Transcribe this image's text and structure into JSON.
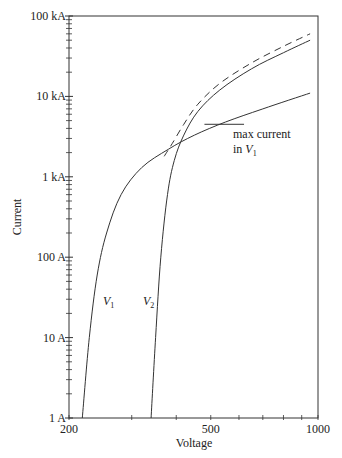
{
  "chart_data": {
    "type": "line",
    "title": "",
    "xlabel": "Voltage",
    "ylabel": "Current",
    "xscale": "log",
    "yscale": "log",
    "xlim": [
      200,
      1000
    ],
    "ylim": [
      1,
      100000
    ],
    "x_tick_labels": [
      "200",
      "500",
      "1000"
    ],
    "x_ticks": [
      200,
      300,
      400,
      500,
      600,
      700,
      800,
      900,
      1000
    ],
    "y_tick_labels": [
      "1 A",
      "10 A",
      "100 A",
      "1 kA",
      "10 kA",
      "100 kA"
    ],
    "y_ticks": [
      1,
      10,
      100,
      1000,
      10000,
      100000
    ],
    "grid": false,
    "legend": null,
    "series": [
      {
        "name": "V1",
        "style": "solid",
        "points": [
          [
            218,
            1
          ],
          [
            228,
            10
          ],
          [
            240,
            60
          ],
          [
            255,
            200
          ],
          [
            280,
            600
          ],
          [
            320,
            1300
          ],
          [
            380,
            2200
          ],
          [
            450,
            3300
          ],
          [
            550,
            4800
          ],
          [
            700,
            7000
          ],
          [
            950,
            11000
          ]
        ]
      },
      {
        "name": "V2",
        "style": "solid",
        "points": [
          [
            340,
            1
          ],
          [
            350,
            10
          ],
          [
            362,
            100
          ],
          [
            378,
            600
          ],
          [
            395,
            1600
          ],
          [
            420,
            3300
          ],
          [
            460,
            6500
          ],
          [
            530,
            12000
          ],
          [
            650,
            22000
          ],
          [
            800,
            35000
          ],
          [
            950,
            50000
          ]
        ]
      },
      {
        "name": "V1 + V2 (combined)",
        "style": "dashed",
        "points": [
          [
            370,
            1800
          ],
          [
            390,
            2600
          ],
          [
            420,
            4500
          ],
          [
            460,
            8000
          ],
          [
            530,
            14500
          ],
          [
            650,
            26000
          ],
          [
            800,
            42000
          ],
          [
            950,
            60000
          ]
        ]
      }
    ],
    "annotations": [
      {
        "text": "max current in V1",
        "line": "V1",
        "level_current": 4500,
        "x_range": [
          480,
          620
        ]
      },
      {
        "text": "V1",
        "at": [
          255,
          18
        ]
      },
      {
        "text": "V2",
        "at": [
          330,
          18
        ]
      }
    ]
  },
  "labels": {
    "xlabel": "Voltage",
    "ylabel": "Current",
    "v1": "V",
    "v1_sub": "1",
    "v2": "V",
    "v2_sub": "2",
    "annot_line1": "max current",
    "annot_line2": "in ",
    "annot_v": "V",
    "annot_sub": "1"
  }
}
